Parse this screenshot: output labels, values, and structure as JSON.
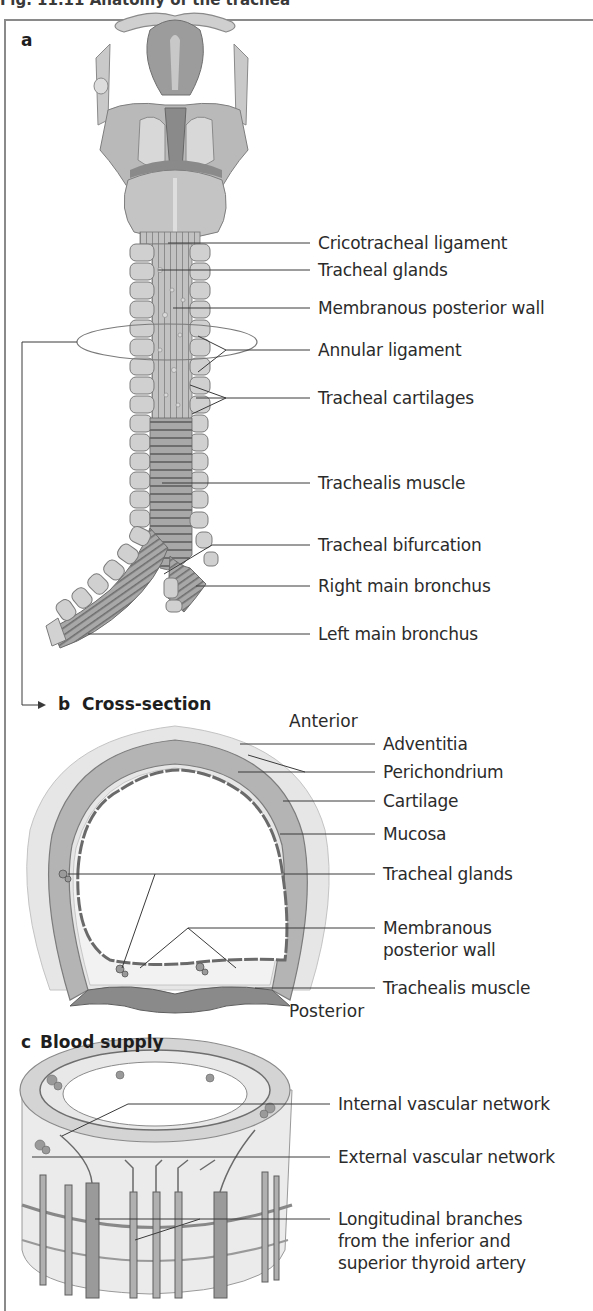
{
  "figure": {
    "title": "Fig. 11.11  Anatomy of the trachea"
  },
  "panels": {
    "a": {
      "letter": "a",
      "labels": [
        "Cricotracheal ligament",
        "Tracheal glands",
        "Membranous posterior wall",
        "Annular ligament",
        "Tracheal cartilages",
        "Trachealis muscle",
        "Tracheal bifurcation",
        "Right main bronchus",
        "Left main bronchus"
      ]
    },
    "b": {
      "letter": "b",
      "title": "Cross-section",
      "orientation_top": "Anterior",
      "orientation_bottom": "Posterior",
      "labels": [
        "Adventitia",
        "Perichondrium",
        "Cartilage",
        "Mucosa",
        "Tracheal glands",
        "Membranous posterior wall",
        "Trachealis muscle"
      ]
    },
    "c": {
      "letter": "c",
      "title": "Blood supply",
      "labels": [
        "Internal vascular network",
        "External vascular network",
        "Longitudinal branches from the inferior and superior thyroid artery"
      ]
    }
  },
  "colors": {
    "frame": "#8a8a8a",
    "tissue_light": "#d9d9d9",
    "tissue_mid": "#b5b5b5",
    "tissue_dark": "#7d7d7d",
    "leader_line": "#3a3a3a"
  }
}
